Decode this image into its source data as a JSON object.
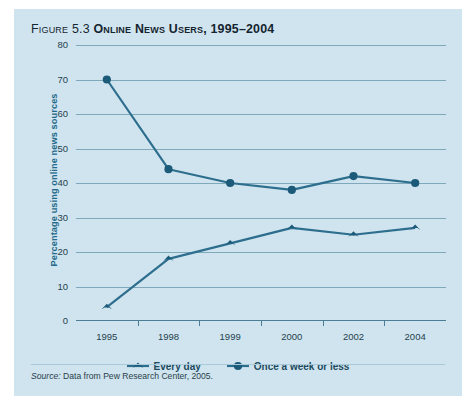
{
  "figure": {
    "label": "Figure 5.3",
    "name": "Online News Users, 1995–2004",
    "source_word": "Source:",
    "source_text": " Data from Pew Research Center, 2005."
  },
  "colors": {
    "panel_background": "#cfe4ee",
    "page_background": "#ffffff",
    "series_line": "#2d6e8e",
    "series_marker": "#1c5a79",
    "gridline": "#7fa8bb",
    "axis": "#4b7e95",
    "axis_title": "#1f6a8c",
    "tick_label": "#26424f",
    "title": "#15242e"
  },
  "chart_data": {
    "type": "line",
    "title": "Figure 5.3 Online News Users, 1995–2004",
    "xlabel": "",
    "ylabel": "Percentage using online news sources",
    "categories": [
      "1995",
      "1998",
      "1999",
      "2000",
      "2002",
      "2004"
    ],
    "ylim": [
      0,
      80
    ],
    "yticks": [
      0,
      10,
      20,
      30,
      40,
      50,
      60,
      70,
      80
    ],
    "ytick_labels": [
      "0",
      "10",
      "20",
      "30",
      "40",
      "50",
      "60",
      "70",
      "80"
    ],
    "grid": true,
    "legend_position": "bottom",
    "series": [
      {
        "name": "Every day",
        "marker": "triangle",
        "values": [
          4,
          18,
          22.5,
          27,
          25,
          27
        ]
      },
      {
        "name": "Once a week or less",
        "marker": "circle",
        "values": [
          70,
          44,
          40,
          38,
          42,
          40
        ]
      }
    ],
    "source": "Source: Data from Pew Research Center, 2005."
  }
}
